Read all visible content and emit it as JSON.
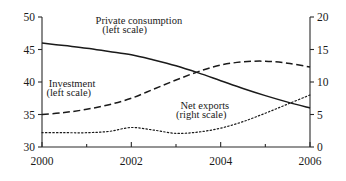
{
  "chart_data": {
    "type": "line",
    "title": "",
    "subtitle": "",
    "xlabel": "",
    "ylabel": "",
    "y2label": "",
    "grid": false,
    "legend_position": "inline-annotations",
    "x": [
      2000,
      2000.5,
      2001,
      2001.5,
      2002,
      2002.5,
      2003,
      2003.5,
      2004,
      2004.5,
      2005,
      2005.5,
      2006
    ],
    "xlim": [
      2000,
      2006
    ],
    "xticks": [
      2000,
      2001,
      2002,
      2003,
      2004,
      2005,
      2006
    ],
    "xtick_labels": [
      "2000",
      "",
      "2002",
      "",
      "2004",
      "",
      "2006"
    ],
    "ylim": [
      30,
      50
    ],
    "yticks": [
      30,
      35,
      40,
      45,
      50
    ],
    "ytick_labels": [
      "30",
      "35",
      "40",
      "45",
      "50"
    ],
    "y2lim": [
      0,
      20
    ],
    "y2ticks": [
      0,
      5,
      10,
      15,
      20
    ],
    "y2tick_labels": [
      "0",
      "5",
      "10",
      "15",
      "20"
    ],
    "series": [
      {
        "name": "Private consumption",
        "scale": "left",
        "style": "solid",
        "color": "#1a1a1a",
        "label_line1": "Private consumption",
        "label_line2": "(left scale)",
        "values": [
          46.0,
          45.6,
          45.2,
          44.7,
          44.2,
          43.4,
          42.5,
          41.4,
          40.2,
          39.0,
          37.9,
          36.9,
          36.0
        ]
      },
      {
        "name": "Investment",
        "scale": "left",
        "style": "dashed",
        "color": "#1a1a1a",
        "label_line1": "Investment",
        "label_line2": "(left scale)",
        "values": [
          35.0,
          35.3,
          35.8,
          36.5,
          37.5,
          38.9,
          40.3,
          41.6,
          42.6,
          43.1,
          43.2,
          42.9,
          42.3
        ]
      },
      {
        "name": "Net exports",
        "scale": "right",
        "style": "dotted",
        "color": "#1a1a1a",
        "label_line1": "Net exports",
        "label_line2": "(right scale)",
        "values": [
          2.2,
          2.2,
          2.2,
          2.4,
          3.0,
          2.6,
          2.1,
          2.3,
          2.9,
          3.9,
          5.2,
          6.6,
          8.0
        ]
      }
    ],
    "annotations": [
      {
        "text": "Private consumption",
        "x": 2001.2,
        "y": 49.0
      },
      {
        "text": "(left scale)",
        "x": 2001.35,
        "y": 47.6
      },
      {
        "text": "Investment",
        "x": 2000.15,
        "y": 39.3
      },
      {
        "text": "(left scale)",
        "x": 2000.1,
        "y": 37.9
      },
      {
        "text": "Net exports",
        "x": 2003.1,
        "y": 35.9
      },
      {
        "text": "(right scale)",
        "x": 2003.0,
        "y": 34.5
      }
    ]
  }
}
